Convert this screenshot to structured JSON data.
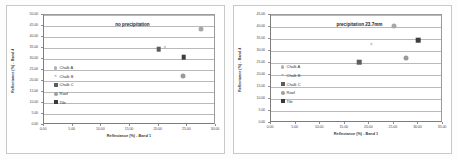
{
  "figure": {
    "background": "#fdfdfd",
    "panel_background": "#ffffff",
    "border_color": "#c9c9c9"
  },
  "legend_symbols": {
    "chalk_a": "small-dot-icon",
    "chalk_b": "cross-icon",
    "chalk_c": "filled-square-icon",
    "roof": "filled-circle-icon",
    "tile": "dark-filled-square-icon"
  },
  "chart_data": [
    {
      "type": "scatter",
      "panel": "left",
      "title": "no precipitation",
      "xlabel": "Reflectance (%) - Band 1",
      "ylabel": "Reflectance (%) - Band 4",
      "xlim": [
        0,
        30
      ],
      "ylim": [
        0,
        50
      ],
      "xticks": [
        "0.00",
        "5.00",
        "10.00",
        "15.00",
        "20.00",
        "25.00",
        "30.00"
      ],
      "xtick_values": [
        0,
        5,
        10,
        15,
        20,
        25,
        30
      ],
      "yticks": [
        "0.00",
        "5.00",
        "10.00",
        "15.00",
        "20.00",
        "25.00",
        "30.00",
        "35.00",
        "40.00",
        "45.00",
        "50.00"
      ],
      "ytick_values": [
        0,
        5,
        10,
        15,
        20,
        25,
        30,
        35,
        40,
        45,
        50
      ],
      "grid": true,
      "grid_axis": "y",
      "legend_position": "inside-left-lower",
      "series": [
        {
          "name": "Chalk A",
          "marker": "dot",
          "x": 27.3,
          "y": 43.5
        },
        {
          "name": "Chalk B",
          "marker": "cross",
          "x": 21.1,
          "y": 35.0
        },
        {
          "name": "Chalk C",
          "marker": "square",
          "x": 20.0,
          "y": 34.4
        },
        {
          "name": "Roof",
          "marker": "circle",
          "x": 24.2,
          "y": 22.5
        },
        {
          "name": "Tile",
          "marker": "square-dark",
          "x": 24.4,
          "y": 30.9
        }
      ]
    },
    {
      "type": "scatter",
      "panel": "right",
      "title": "precipitation 23.7mm",
      "xlabel": "Reflectance (%) - Band 1",
      "ylabel": "Reflectance (%) - Band 4",
      "xlim": [
        0,
        35
      ],
      "ylim": [
        0,
        45
      ],
      "xticks": [
        "0.00",
        "5.00",
        "10.00",
        "15.00",
        "20.00",
        "25.00",
        "30.00",
        "35.00"
      ],
      "xtick_values": [
        0,
        5,
        10,
        15,
        20,
        25,
        30,
        35
      ],
      "yticks": [
        "0.00",
        "5.00",
        "10.00",
        "15.00",
        "20.00",
        "25.00",
        "30.00",
        "35.00",
        "40.00",
        "45.00"
      ],
      "ytick_values": [
        0,
        5,
        10,
        15,
        20,
        25,
        30,
        35,
        40,
        45
      ],
      "grid": true,
      "grid_axis": "y",
      "legend_position": "inside-left-lower",
      "series": [
        {
          "name": "Chalk A",
          "marker": "dot",
          "x": 25.0,
          "y": 40.4
        },
        {
          "name": "Chalk B",
          "marker": "cross",
          "x": 20.4,
          "y": 32.4
        },
        {
          "name": "Chalk C",
          "marker": "square",
          "x": 17.9,
          "y": 25.4
        },
        {
          "name": "Roof",
          "marker": "circle",
          "x": 27.4,
          "y": 27.0
        },
        {
          "name": "Tile",
          "marker": "square-dark",
          "x": 29.9,
          "y": 34.5
        }
      ]
    }
  ],
  "legend": {
    "items": [
      {
        "label": "Chalk A"
      },
      {
        "label": "Chalk B"
      },
      {
        "label": "Chalk C"
      },
      {
        "label": "Roof"
      },
      {
        "label": "Tile"
      }
    ]
  }
}
